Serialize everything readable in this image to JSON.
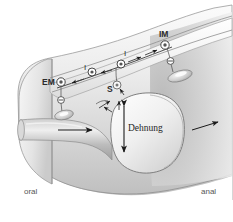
{
  "figure": {
    "background_color": "#ffffff",
    "width": 233,
    "height": 222
  },
  "orientation": {
    "oral_label": "oral",
    "anal_label": "anal"
  },
  "annotations": {
    "distension_label": "Dehnung",
    "sensory_label": "S",
    "interneuron_label_oral": "I",
    "interneuron_label_anal": "I",
    "excitatory_motor_label": "EM",
    "inhibitory_motor_label": "IM",
    "inhibitory_sign": "⊖",
    "neuron_symbol": "◎"
  },
  "colors": {
    "outline": "#8f8f8f",
    "nerve_line": "#4a4a4a",
    "arrow": "#1a1a1a",
    "text": "#2b2b2b",
    "muted_text": "#555555",
    "wall_light": "#f2f2f2",
    "wall_mid": "#d8d8d8",
    "wall_dark": "#b0b0b0",
    "lumen_shadow": "#9a9a9a"
  },
  "elements": {
    "gut_tube": "gut-tube",
    "contracted_segment": "contracted-lumen-oral",
    "distended_bolus": "distended-bolus-segment",
    "muscle_layer": "smooth-muscle-wall-band",
    "propulsion_arrow_oral": "propulsion-arrow-oral",
    "propulsion_arrow_anal": "propulsion-arrow-anal",
    "distension_arrow": "distension-double-arrow",
    "nerve_plexus": "enteric-nerve-plexus"
  }
}
